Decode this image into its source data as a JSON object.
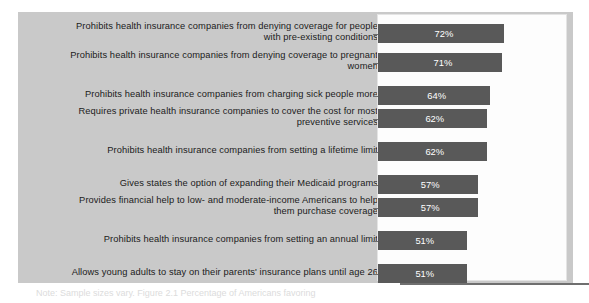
{
  "figure": {
    "background_color": "#c9c9c9",
    "plot_background_color": "#fdfdfd",
    "bar_color": "#595959",
    "label_color": "#1b1b1b",
    "value_label_color": "#ffffff"
  },
  "footnote": {
    "text": "Note: Sample sizes vary. Figure 2.1  Percentage of Americans favoring"
  },
  "chart_data": {
    "type": "bar",
    "orientation": "horizontal",
    "title": "",
    "subtitle": "",
    "xlabel": "",
    "ylabel": "",
    "xlim": [
      0,
      100
    ],
    "grid": false,
    "legend": false,
    "value_suffix": "%",
    "categories": [
      "Prohibits health insurance companies from denying coverage for people\nwith pre-existing conditions",
      "Prohibits health insurance companies from denying coverage to pregnant\nwomen",
      "Prohibits health insurance companies from charging sick people more",
      "Requires private health insurance companies to cover the cost for most\npreventive services",
      "Prohibits health insurance companies from setting a lifetime limit",
      "Gives states the option of expanding their Medicaid programs",
      "Provides financial help to low- and moderate-income Americans to help\nthem purchase coverage",
      "Prohibits health insurance companies from setting an annual limit",
      "Allows young adults to stay on their parents' insurance plans until age 26"
    ],
    "values": [
      72,
      71,
      64,
      62,
      62,
      57,
      57,
      51,
      51
    ],
    "value_labels": [
      "72%",
      "71%",
      "64%",
      "62%",
      "62%",
      "57%",
      "57%",
      "51%",
      "51%"
    ]
  }
}
